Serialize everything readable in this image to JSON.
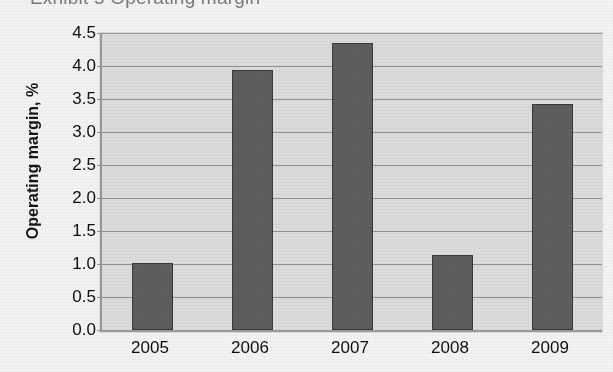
{
  "chart_data": {
    "type": "bar",
    "title": "Exhibit 5   Operating margin",
    "xlabel": "",
    "ylabel": "Operating margin, %",
    "categories": [
      "2005",
      "2006",
      "2007",
      "2008",
      "2009"
    ],
    "values": [
      1.01,
      3.94,
      4.35,
      1.13,
      3.42
    ],
    "series": [
      {
        "name": "Operating margin",
        "values": [
          1.01,
          3.94,
          4.35,
          1.13,
          3.42
        ]
      }
    ],
    "ylim": [
      0.0,
      4.5
    ],
    "ytick_labels": [
      "0.0",
      "0.5",
      "1.0",
      "1.5",
      "2.0",
      "2.5",
      "3.0",
      "3.5",
      "4.0",
      "4.5"
    ],
    "ytick_values": [
      0.0,
      0.5,
      1.0,
      1.5,
      2.0,
      2.5,
      3.0,
      3.5,
      4.0,
      4.5
    ],
    "grid": true,
    "legend": false,
    "legend_position": "none",
    "bar_color": "#5e5e5e",
    "bar_edge_color": "#3a3a3a",
    "plot_background_color": "#dcdcda",
    "gridline_color": "#8f8f8d",
    "axis_color": "#9a9a98",
    "page_background_color": "#f3f3f1",
    "text_color": "#0f0f0f"
  }
}
